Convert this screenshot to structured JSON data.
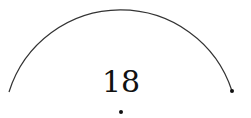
{
  "diagram": {
    "type": "circle-arc",
    "label": "18",
    "stroke_color": "#333333",
    "point_color": "#111111",
    "arc": {
      "start": [
        9,
        92
      ],
      "top": [
        120,
        8
      ],
      "end": [
        232,
        91
      ]
    },
    "center_point": [
      121,
      112
    ],
    "endpoint": [
      232,
      91
    ]
  }
}
